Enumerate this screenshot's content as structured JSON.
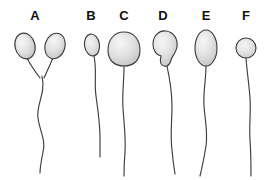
{
  "figure": {
    "background_color": "#ffffff",
    "width": 272,
    "height": 180,
    "outline_color": "#3a3a3a",
    "tail_color": "#3d3d3d",
    "head_fill_light": "#f2f2f2",
    "head_fill_mid": "#dcdcdc",
    "head_fill_dark": "#bdbdbd",
    "label_color": "#101010"
  },
  "specimens": [
    {
      "id": "a",
      "label": "A",
      "label_x": 35,
      "label_y": 20,
      "head_shape": "double-head",
      "description": "two teardrop heads converging into one shared tail"
    },
    {
      "id": "b",
      "label": "B",
      "label_x": 91,
      "label_y": 20,
      "head_shape": "small-oval",
      "description": "small narrow oval head"
    },
    {
      "id": "c",
      "label": "C",
      "label_x": 124,
      "label_y": 20,
      "head_shape": "large-round",
      "description": "large broad rounded head"
    },
    {
      "id": "d",
      "label": "D",
      "label_x": 163,
      "label_y": 20,
      "head_shape": "irregular-notched",
      "description": "irregular pear shaped head with notch"
    },
    {
      "id": "e",
      "label": "E",
      "label_x": 206,
      "label_y": 20,
      "head_shape": "elongated-ellipse",
      "description": "tall narrow elongated head"
    },
    {
      "id": "f",
      "label": "F",
      "label_x": 246,
      "label_y": 20,
      "head_shape": "small-round",
      "description": "small round head with short tail"
    }
  ]
}
